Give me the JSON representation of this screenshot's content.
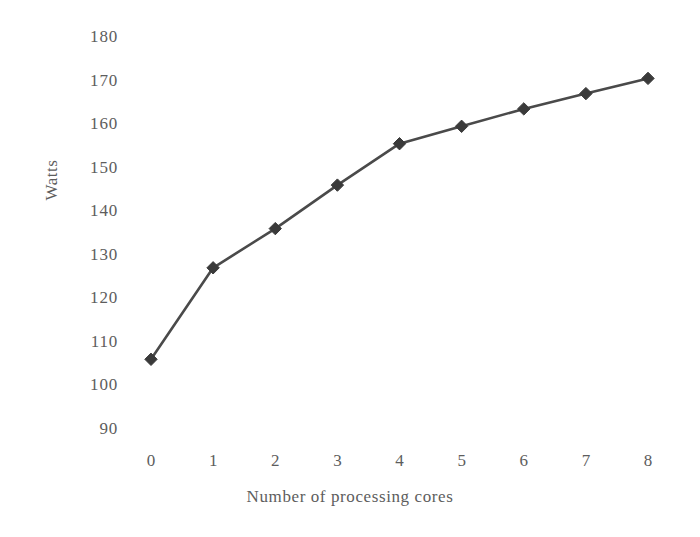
{
  "chart_data": {
    "type": "line",
    "title": "",
    "xlabel": "Number of processing cores",
    "ylabel": "Watts",
    "x": [
      0,
      1,
      2,
      3,
      4,
      5,
      6,
      7,
      8
    ],
    "values": [
      106,
      127,
      136,
      146,
      155.5,
      159.5,
      163.5,
      167,
      170.5
    ],
    "series": [
      {
        "name": "Power consumption",
        "values": [
          106,
          127,
          136,
          146,
          155.5,
          159.5,
          163.5,
          167,
          170.5
        ]
      }
    ],
    "xtick_labels": [
      "0",
      "1",
      "2",
      "3",
      "4",
      "5",
      "6",
      "7",
      "8"
    ],
    "ytick_labels": [
      "90",
      "100",
      "110",
      "120",
      "130",
      "140",
      "150",
      "160",
      "170",
      "180"
    ],
    "ytick_values": [
      90,
      100,
      110,
      120,
      130,
      140,
      150,
      160,
      170,
      180
    ],
    "xlim": [
      0,
      8
    ],
    "ylim": [
      90,
      180
    ],
    "grid": false,
    "legend": "none",
    "marker": "diamond",
    "line_color": "#4a4a4a",
    "marker_color": "#3a3a3a",
    "text_color": "#5d5d5d",
    "background_color": "#ffffff"
  },
  "axes": {
    "y_title": "Watts",
    "x_title": "Number of processing cores"
  }
}
